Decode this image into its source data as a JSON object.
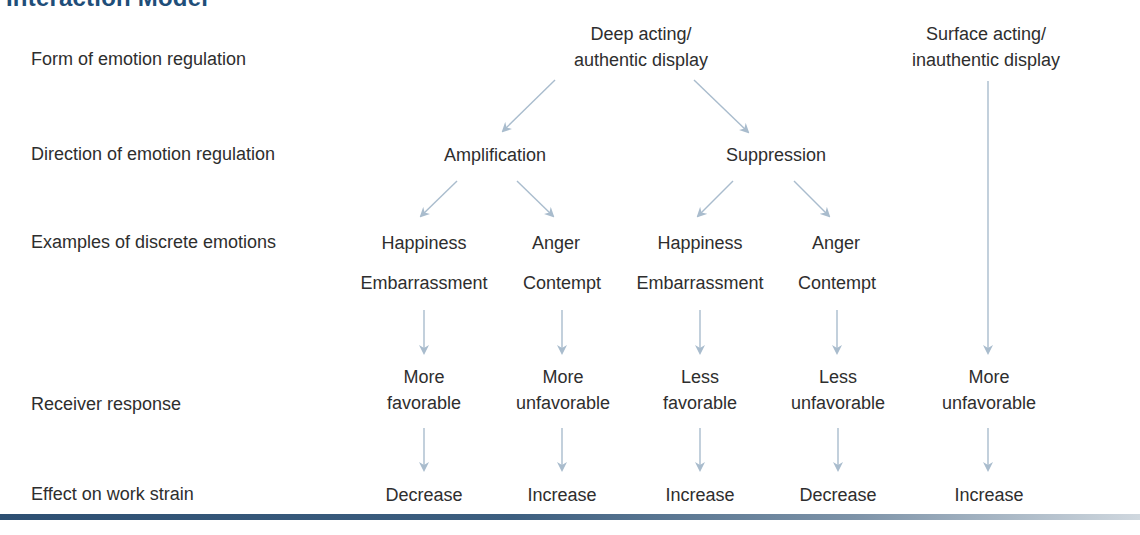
{
  "title": "Interaction Model",
  "row_labels": [
    "Form of emotion regulation",
    "Direction of emotion regulation",
    "Examples of discrete emotions",
    "Receiver response",
    "Effect on work strain"
  ],
  "forms": {
    "deep": {
      "line1": "Deep acting/",
      "line2": "authentic display"
    },
    "surface": {
      "line1": "Surface acting/",
      "line2": "inauthentic display"
    }
  },
  "directions": {
    "amplification": "Amplification",
    "suppression": "Suppression"
  },
  "columns": [
    {
      "emotion1": "Happiness",
      "emotion2": "Embarrassment",
      "response1": "More",
      "response2": "favorable",
      "effect": "Decrease"
    },
    {
      "emotion1": "Anger",
      "emotion2": "Contempt",
      "response1": "More",
      "response2": "unfavorable",
      "effect": "Increase"
    },
    {
      "emotion1": "Happiness",
      "emotion2": "Embarrassment",
      "response1": "Less",
      "response2": "favorable",
      "effect": "Increase"
    },
    {
      "emotion1": "Anger",
      "emotion2": "Contempt",
      "response1": "Less",
      "response2": "unfavorable",
      "effect": "Decrease"
    },
    {
      "response1": "More",
      "response2": "unfavorable",
      "effect": "Increase"
    }
  ],
  "colors": {
    "title": "#1f4e79",
    "text": "#2e2e2e",
    "arrow": "#a9bccd",
    "bottom_bar": "#2d4f72"
  }
}
